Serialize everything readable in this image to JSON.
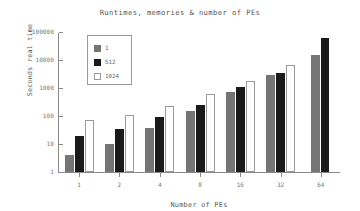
{
  "chart_data": {
    "type": "bar",
    "title": "Runtimes, memories & number of PEs",
    "xlabel": "Number of PEs",
    "ylabel": "Seconds real time",
    "categories": [
      "1",
      "2",
      "4",
      "8",
      "16",
      "32",
      "64"
    ],
    "yscale": "log",
    "ylim": [
      1,
      100000
    ],
    "yticks": [
      "1",
      "10",
      "100",
      "1000",
      "10000",
      "100000"
    ],
    "grid": false,
    "legend_position": "upper-left-inside",
    "series": [
      {
        "name": "1",
        "color": "#757575",
        "values": [
          4,
          10,
          38,
          150,
          750,
          3000,
          15000
        ]
      },
      {
        "name": "512",
        "color": "#1a1a1a",
        "values": [
          20,
          35,
          90,
          250,
          1050,
          3500,
          60000
        ]
      },
      {
        "name": "1024",
        "color": "#ffffff",
        "values": [
          70,
          110,
          220,
          600,
          1800,
          6500,
          null
        ]
      }
    ]
  }
}
